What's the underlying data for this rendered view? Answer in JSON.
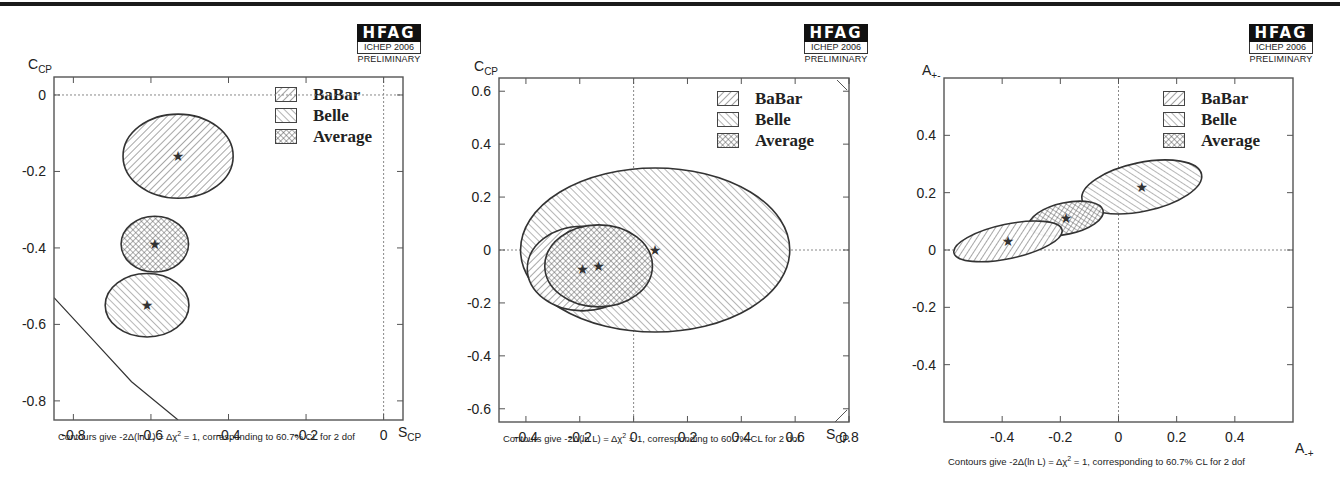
{
  "chart_data": [
    {
      "type": "scatter",
      "subtype": "contour-ellipses",
      "title": "π⁺ π⁻ S_CP vs C_CP",
      "title_parts": {
        "a": "π",
        "a_sup": "+",
        "b": " π",
        "b_sup": "-",
        "c": " S",
        "c_sub": "CP",
        "d": " vs C",
        "d_sub": "CP"
      },
      "xlabel": "S_CP",
      "xlabel_main": "S",
      "xlabel_sub": "CP",
      "ylabel": "C_CP",
      "ylabel_main": "C",
      "ylabel_sub": "CP",
      "xlim": [
        -0.85,
        0.05
      ],
      "ylim": [
        -0.85,
        0.047
      ],
      "xticks": [
        -0.8,
        -0.6,
        -0.4,
        -0.2,
        0
      ],
      "xtick_labels": [
        "-0.8",
        "-0.6",
        "-0.4",
        "-0.2",
        "0"
      ],
      "yticks": [
        0,
        -0.2,
        -0.4,
        -0.6,
        -0.8
      ],
      "ytick_labels": [
        "0",
        "-0.2",
        "-0.4",
        "-0.6",
        "-0.8"
      ],
      "grid": false,
      "reference_lines": {
        "x": 0,
        "y": 0
      },
      "legend_position": "upper right",
      "legend": [
        "BaBar",
        "Belle",
        "Average"
      ],
      "series": [
        {
          "name": "BaBar",
          "center": [
            -0.53,
            -0.16
          ],
          "rx": 0.142,
          "ry": 0.11,
          "rotation": 0
        },
        {
          "name": "Average",
          "center": [
            -0.59,
            -0.39
          ],
          "rx": 0.087,
          "ry": 0.073,
          "rotation": 0
        },
        {
          "name": "Belle",
          "center": [
            -0.61,
            -0.55
          ],
          "rx": 0.108,
          "ry": 0.083,
          "rotation": 0
        }
      ],
      "physical_boundary": [
        [
          -0.85,
          -0.53
        ],
        [
          -0.75,
          -0.64
        ],
        [
          -0.65,
          -0.75
        ],
        [
          -0.53,
          -0.85
        ]
      ],
      "caption": "Contours give -2Δ(ln L) = Δχ² = 1, corresponding to 60.7% CL for 2 dof",
      "caption_parts": {
        "pre": "Contours give -2Δ(ln L) = Δχ",
        "sup": "2",
        "post": " = 1, corresponding to 60.7% CL for 2 dof"
      },
      "badge": {
        "name": "HFAG",
        "conference": "ICHEP 2006",
        "status": "PRELIMINARY"
      }
    },
    {
      "type": "scatter",
      "subtype": "contour-ellipses",
      "title": "ρ⁺ ρ⁻ S_CP vs C_CP",
      "title_parts": {
        "a": "ρ",
        "a_sup": "+",
        "b": " ρ",
        "b_sup": "-",
        "c": " S",
        "c_sub": "CP",
        "d": " vs C",
        "d_sub": "CP"
      },
      "xlabel": "S_CP",
      "xlabel_main": "S",
      "xlabel_sub": "CP",
      "ylabel": "C_CP",
      "ylabel_main": "C",
      "ylabel_sub": "CP",
      "xlim": [
        -0.5,
        0.8
      ],
      "ylim": [
        -0.65,
        0.65
      ],
      "xticks": [
        -0.4,
        -0.2,
        0,
        0.2,
        0.4,
        0.6,
        0.8
      ],
      "xtick_labels": [
        "-0.4",
        "-0.2",
        "0",
        "0.2",
        "0.4",
        "0.6",
        "0.8"
      ],
      "yticks": [
        0.6,
        0.4,
        0.2,
        0,
        -0.2,
        -0.4,
        -0.6
      ],
      "ytick_labels": [
        "0.6",
        "0.4",
        "0.2",
        "0",
        "-0.2",
        "-0.4",
        "-0.6"
      ],
      "grid": false,
      "reference_lines": {
        "x": 0,
        "y": 0
      },
      "legend_position": "upper right",
      "legend": [
        "BaBar",
        "Belle",
        "Average"
      ],
      "series": [
        {
          "name": "Belle",
          "center": [
            0.08,
            0.0
          ],
          "rx": 0.5,
          "ry": 0.31,
          "rotation": 0
        },
        {
          "name": "BaBar",
          "center": [
            -0.19,
            -0.07
          ],
          "rx": 0.205,
          "ry": 0.16,
          "rotation": 0
        },
        {
          "name": "Average",
          "center": [
            -0.13,
            -0.06
          ],
          "rx": 0.2,
          "ry": 0.155,
          "rotation": 0
        }
      ],
      "caption": "Contours give -2Δ(ln L) = Δχ² = 1, corresponding to 60.7% CL for 2 dof",
      "caption_parts": {
        "pre": "Contours give -2Δ(ln L) = Δχ",
        "sup": "2",
        "post": " = 1, corresponding to 60.7% CL for 2 dof"
      },
      "badge": {
        "name": "HFAG",
        "conference": "ICHEP 2006",
        "status": "PRELIMINARY"
      }
    },
    {
      "type": "scatter",
      "subtype": "contour-ellipses",
      "title": "ρ⁺⁻π⁻⁺.DCPV A₋₊ vs A₊₋",
      "title_parts": {
        "a": "ρ",
        "a_sup": "+-",
        "b": "π",
        "b_sup": "-+",
        "c": ".DCPV A",
        "c_sub": "-+",
        "d": " vs A",
        "d_sub": "+-"
      },
      "xlabel": "A_-+",
      "xlabel_main": "A",
      "xlabel_sub": "-+",
      "ylabel": "A_+-",
      "ylabel_main": "A",
      "ylabel_sub": "+-",
      "xlim": [
        -0.6,
        0.6
      ],
      "ylim": [
        -0.6,
        0.6
      ],
      "xticks": [
        -0.4,
        -0.2,
        0,
        0.2,
        0.4
      ],
      "xtick_labels": [
        "-0.4",
        "-0.2",
        "0",
        "0.2",
        "0.4"
      ],
      "yticks": [
        0.4,
        0.2,
        0,
        -0.2,
        -0.4
      ],
      "ytick_labels": [
        "0.4",
        "0.2",
        "0",
        "-0.2",
        "-0.4"
      ],
      "grid": false,
      "reference_lines": {
        "x": 0,
        "y": 0
      },
      "legend_position": "upper right",
      "legend": [
        "BaBar",
        "Belle",
        "Average"
      ],
      "series": [
        {
          "name": "Belle",
          "center": [
            0.08,
            0.22
          ],
          "rx": 0.21,
          "ry": 0.085,
          "rotation": 12
        },
        {
          "name": "Average",
          "center": [
            -0.18,
            0.11
          ],
          "rx": 0.13,
          "ry": 0.055,
          "rotation": 12
        },
        {
          "name": "BaBar",
          "center": [
            -0.38,
            0.03
          ],
          "rx": 0.19,
          "ry": 0.06,
          "rotation": 12
        }
      ],
      "caption": "Contours give -2Δ(ln L) = Δχ² = 1, corresponding to 60.7% CL for 2 dof",
      "caption_parts": {
        "pre": "Contours give -2Δ(ln L) = Δχ",
        "sup": "2",
        "post": " = 1, corresponding to 60.7% CL for 2 dof"
      },
      "badge": {
        "name": "HFAG",
        "conference": "ICHEP 2006",
        "status": "PRELIMINARY"
      }
    }
  ],
  "layout": [
    {
      "panel_left": 0,
      "frame": [
        54,
        77,
        403,
        420
      ],
      "title_pos": [
        148,
        25
      ],
      "logo_pos": [
        357,
        24
      ],
      "legend_pos": [
        275,
        84
      ],
      "ylabel_pos": [
        28,
        56
      ],
      "xlabel_pos": [
        398,
        424
      ],
      "caption_pos": [
        58,
        430
      ]
    },
    {
      "panel_left": 0,
      "frame": [
        499,
        78,
        849,
        422
      ],
      "title_pos": [
        590,
        25
      ],
      "logo_pos": [
        804,
        24
      ],
      "legend_pos": [
        717,
        88
      ],
      "ylabel_pos": [
        474,
        58
      ],
      "xlabel_pos": [
        826,
        426
      ],
      "caption_pos": [
        503,
        432
      ]
    },
    {
      "panel_left": 0,
      "frame": [
        944,
        78,
        1293,
        422
      ],
      "title_pos": [
        990,
        25
      ],
      "logo_pos": [
        1249,
        24
      ],
      "legend_pos": [
        1163,
        88
      ],
      "ylabel_pos": [
        922,
        62
      ],
      "xlabel_pos": [
        1295,
        440
      ],
      "caption_pos": [
        948,
        455
      ]
    }
  ],
  "style": {
    "ink": "#333333",
    "hatch": "#555555",
    "frame": "#555555",
    "ref_line": "#888888"
  }
}
